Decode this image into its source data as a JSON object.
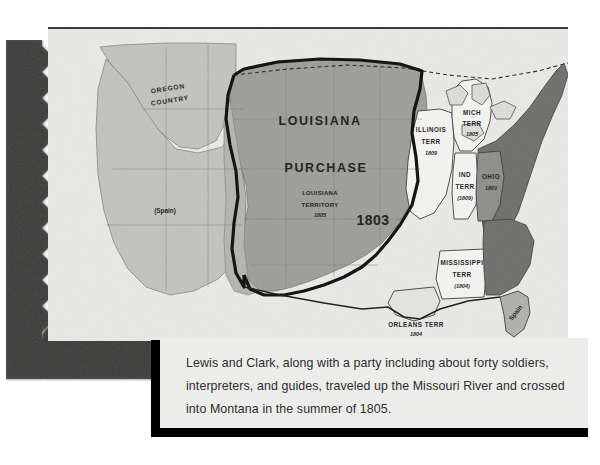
{
  "figure": {
    "type": "historical-map",
    "caption": "Lewis and Clark, along with a party including about forty soldiers, interpreters, and guides, traveled up the Missouri River and crossed into Montana in the summer of 1805."
  },
  "map": {
    "background_color": "#e9e9e7",
    "purchase_fill": "#9d9d9a",
    "states_fill": "#6e6e6c",
    "territory_fill": "#f2f2f0",
    "unclaimed_fill": "#c9c9c5",
    "boundary_color": "#0d0d0d",
    "labels": {
      "oregon_country": "OREGON\nCOUNTRY",
      "oregon_line1": "OREGON",
      "oregon_line2": "COUNTRY",
      "louisiana": "LOUISIANA",
      "purchase": "PURCHASE",
      "louisiana_territory_line1": "LOUISIANA",
      "louisiana_territory_line2": "TERRITORY",
      "louisiana_territory_year": "1805",
      "purchase_year": "1803",
      "spain_southwest": "(Spain)",
      "spain_florida": "Spain"
    },
    "territories": [
      {
        "name": "ILLINOIS",
        "suffix": "TERR",
        "year": "1809"
      },
      {
        "name": "MICH",
        "suffix": "TERR",
        "year": "1805"
      },
      {
        "name": "IND",
        "suffix": "TERR",
        "year": "(1809)"
      },
      {
        "name": "OHIO",
        "suffix": "",
        "year": "1803"
      },
      {
        "name": "MISSISSIPPI",
        "suffix": "TERR",
        "year": "(1804)"
      },
      {
        "name": "ORLEANS TERR",
        "suffix": "",
        "year": "1804"
      }
    ]
  }
}
